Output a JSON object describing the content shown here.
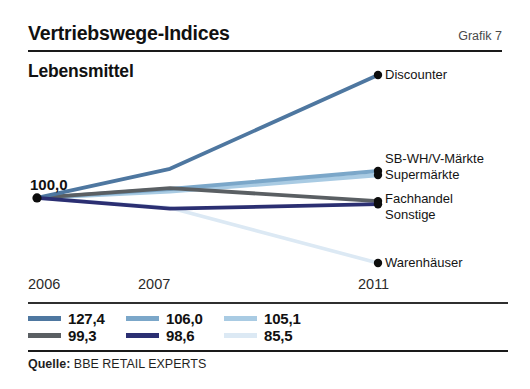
{
  "header": {
    "title": "Vertriebswege-Indices",
    "figure_number": "Grafik 7",
    "subtitle": "Lebensmittel"
  },
  "footer": {
    "source_label": "Quelle:",
    "source_value": "BBE RETAIL EXPERTS"
  },
  "chart_data": {
    "type": "line",
    "title": "Vertriebswege-Indices",
    "subtitle": "Lebensmittel",
    "xlabel": "",
    "ylabel": "",
    "grid": false,
    "legend_position": "bottom-left",
    "base_value_label": "100,0",
    "x": [
      "2006",
      "2007",
      "2011"
    ],
    "xlim": [
      2006,
      2011
    ],
    "ylim": [
      85.5,
      127.4
    ],
    "series": [
      {
        "name": "Discounter",
        "color": "#4e77a0",
        "values": [
          100.0,
          106.5,
          127.4
        ],
        "end_label": "127,4"
      },
      {
        "name": "SB-WH/V-Märkte",
        "color": "#7ba7c9",
        "values": [
          100.0,
          102.0,
          106.0
        ],
        "end_label": "106,0"
      },
      {
        "name": "Supermärkte",
        "color": "#a9cbe3",
        "values": [
          100.0,
          101.5,
          105.1
        ],
        "end_label": "105,1"
      },
      {
        "name": "Fachhandel",
        "color": "#5a5f63",
        "values": [
          100.0,
          102.2,
          99.3
        ],
        "end_label": "99,3"
      },
      {
        "name": "Sonstige",
        "color": "#2b2f72",
        "values": [
          100.0,
          97.6,
          98.6
        ],
        "end_label": "98,6"
      },
      {
        "name": "Warenhäuser",
        "color": "#dce9f4",
        "values": [
          100.0,
          97.8,
          85.5
        ],
        "end_label": "85,5"
      }
    ],
    "legend": [
      {
        "value": "127,4",
        "color": "#4e77a0"
      },
      {
        "value": "106,0",
        "color": "#7ba7c9"
      },
      {
        "value": "105,1",
        "color": "#a9cbe3"
      },
      {
        "value": "99,3",
        "color": "#5a5f63"
      },
      {
        "value": "98,6",
        "color": "#2b2f72"
      },
      {
        "value": "85,5",
        "color": "#dce9f4"
      }
    ],
    "tick_labels": [
      "2006",
      "2007",
      "2011"
    ]
  }
}
